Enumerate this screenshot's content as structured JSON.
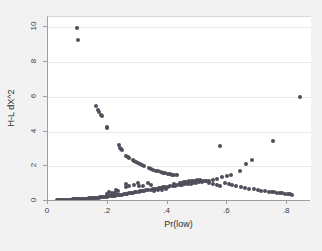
{
  "chart_data": {
    "type": "scatter",
    "title": "",
    "xlabel": "Pr(low)",
    "ylabel": "H-L dX^2",
    "xlim": [
      0,
      0.88
    ],
    "ylim": [
      0,
      10.6
    ],
    "xticks": [
      0,
      0.2,
      0.4,
      0.6,
      0.8
    ],
    "xticklabels": [
      "0",
      ".2",
      ".4",
      ".6",
      ".8"
    ],
    "yticks": [
      0,
      2,
      4,
      6,
      8,
      10
    ],
    "yticklabels": [
      "0",
      "2",
      "4",
      "6",
      "8",
      "10"
    ],
    "grid": "horizontal",
    "legend": "none",
    "marker_color": "#4f4f5a",
    "plot_bgcolor": "#ffffff",
    "figure_bgcolor": "#f2f2f2",
    "series": [
      {
        "name": "H-L dX^2 vs Pr(low)",
        "points": [
          [
            0.098,
            9.95
          ],
          [
            0.1,
            9.27
          ],
          [
            0.842,
            6.02
          ],
          [
            0.162,
            5.48
          ],
          [
            0.168,
            5.22
          ],
          [
            0.172,
            5.1
          ],
          [
            0.176,
            4.96
          ],
          [
            0.18,
            4.88
          ],
          [
            0.196,
            4.27
          ],
          [
            0.198,
            4.18
          ],
          [
            0.238,
            3.22
          ],
          [
            0.241,
            3.08
          ],
          [
            0.245,
            3.02
          ],
          [
            0.249,
            2.92
          ],
          [
            0.262,
            2.6
          ],
          [
            0.268,
            2.52
          ],
          [
            0.272,
            2.46
          ],
          [
            0.283,
            2.36
          ],
          [
            0.289,
            2.3
          ],
          [
            0.295,
            2.24
          ],
          [
            0.301,
            2.2
          ],
          [
            0.308,
            2.14
          ],
          [
            0.315,
            2.08
          ],
          [
            0.322,
            2.04
          ],
          [
            0.338,
            1.9
          ],
          [
            0.345,
            1.84
          ],
          [
            0.352,
            1.8
          ],
          [
            0.362,
            1.74
          ],
          [
            0.369,
            1.7
          ],
          [
            0.378,
            1.68
          ],
          [
            0.386,
            1.64
          ],
          [
            0.393,
            1.6
          ],
          [
            0.401,
            1.58
          ],
          [
            0.409,
            1.54
          ],
          [
            0.416,
            1.52
          ],
          [
            0.423,
            1.5
          ],
          [
            0.431,
            1.48
          ],
          [
            0.575,
            3.16
          ],
          [
            0.752,
            3.46
          ],
          [
            0.683,
            2.34
          ],
          [
            0.662,
            2.12
          ],
          [
            0.641,
            1.72
          ],
          [
            0.612,
            1.48
          ],
          [
            0.598,
            1.44
          ],
          [
            0.583,
            1.36
          ],
          [
            0.566,
            1.28
          ],
          [
            0.552,
            1.22
          ],
          [
            0.54,
            1.18
          ],
          [
            0.528,
            1.14
          ],
          [
            0.516,
            1.1
          ],
          [
            0.506,
            1.08
          ],
          [
            0.496,
            1.04
          ],
          [
            0.486,
            1.02
          ],
          [
            0.477,
            1.0
          ],
          [
            0.468,
            0.98
          ],
          [
            0.459,
            0.96
          ],
          [
            0.45,
            0.94
          ],
          [
            0.441,
            0.92
          ],
          [
            0.433,
            0.9
          ],
          [
            0.425,
            0.88
          ],
          [
            0.417,
            0.86
          ],
          [
            0.409,
            0.84
          ],
          [
            0.401,
            0.82
          ],
          [
            0.393,
            0.8
          ],
          [
            0.386,
            0.78
          ],
          [
            0.378,
            0.76
          ],
          [
            0.371,
            0.74
          ],
          [
            0.364,
            0.72
          ],
          [
            0.357,
            0.7
          ],
          [
            0.35,
            0.68
          ],
          [
            0.343,
            0.66
          ],
          [
            0.336,
            0.64
          ],
          [
            0.329,
            0.62
          ],
          [
            0.322,
            0.6
          ],
          [
            0.316,
            0.58
          ],
          [
            0.309,
            0.56
          ],
          [
            0.303,
            0.54
          ],
          [
            0.296,
            0.52
          ],
          [
            0.29,
            0.5
          ],
          [
            0.284,
            0.48
          ],
          [
            0.278,
            0.46
          ],
          [
            0.272,
            0.44
          ],
          [
            0.266,
            0.42
          ],
          [
            0.26,
            0.4
          ],
          [
            0.254,
            0.38
          ],
          [
            0.248,
            0.36
          ],
          [
            0.242,
            0.34
          ],
          [
            0.236,
            0.33
          ],
          [
            0.23,
            0.32
          ],
          [
            0.224,
            0.3
          ],
          [
            0.219,
            0.29
          ],
          [
            0.213,
            0.28
          ],
          [
            0.207,
            0.27
          ],
          [
            0.202,
            0.26
          ],
          [
            0.196,
            0.25
          ],
          [
            0.191,
            0.24
          ],
          [
            0.185,
            0.23
          ],
          [
            0.18,
            0.22
          ],
          [
            0.174,
            0.21
          ],
          [
            0.169,
            0.2
          ],
          [
            0.164,
            0.19
          ],
          [
            0.158,
            0.18
          ],
          [
            0.153,
            0.17
          ],
          [
            0.148,
            0.16
          ],
          [
            0.143,
            0.16
          ],
          [
            0.138,
            0.15
          ],
          [
            0.133,
            0.14
          ],
          [
            0.128,
            0.14
          ],
          [
            0.123,
            0.13
          ],
          [
            0.118,
            0.12
          ],
          [
            0.113,
            0.12
          ],
          [
            0.108,
            0.11
          ],
          [
            0.103,
            0.11
          ],
          [
            0.098,
            0.1
          ],
          [
            0.093,
            0.1
          ],
          [
            0.088,
            0.09
          ],
          [
            0.083,
            0.09
          ],
          [
            0.078,
            0.08
          ],
          [
            0.073,
            0.08
          ],
          [
            0.068,
            0.07
          ],
          [
            0.063,
            0.07
          ],
          [
            0.058,
            0.06
          ],
          [
            0.053,
            0.06
          ],
          [
            0.048,
            0.05
          ],
          [
            0.043,
            0.05
          ],
          [
            0.038,
            0.04
          ],
          [
            0.034,
            0.04
          ],
          [
            0.03,
            0.03
          ],
          [
            0.262,
            0.78
          ],
          [
            0.272,
            0.88
          ],
          [
            0.287,
            0.92
          ],
          [
            0.305,
            0.88
          ],
          [
            0.318,
            0.84
          ],
          [
            0.227,
            0.62
          ],
          [
            0.234,
            0.55
          ],
          [
            0.356,
            0.58
          ],
          [
            0.368,
            0.62
          ],
          [
            0.382,
            0.66
          ],
          [
            0.396,
            0.7
          ],
          [
            0.455,
            1.08
          ],
          [
            0.463,
            1.12
          ],
          [
            0.472,
            1.14
          ],
          [
            0.481,
            1.16
          ],
          [
            0.49,
            1.18
          ],
          [
            0.499,
            1.2
          ],
          [
            0.508,
            1.2
          ],
          [
            0.518,
            1.18
          ],
          [
            0.53,
            1.14
          ],
          [
            0.592,
            1.02
          ],
          [
            0.604,
            0.96
          ],
          [
            0.617,
            0.9
          ],
          [
            0.629,
            0.86
          ],
          [
            0.646,
            0.8
          ],
          [
            0.658,
            0.76
          ],
          [
            0.672,
            0.72
          ],
          [
            0.689,
            0.68
          ],
          [
            0.701,
            0.64
          ],
          [
            0.714,
            0.6
          ],
          [
            0.726,
            0.58
          ],
          [
            0.739,
            0.54
          ],
          [
            0.748,
            0.52
          ],
          [
            0.757,
            0.5
          ],
          [
            0.766,
            0.48
          ],
          [
            0.775,
            0.46
          ],
          [
            0.784,
            0.44
          ],
          [
            0.793,
            0.42
          ],
          [
            0.802,
            0.4
          ],
          [
            0.811,
            0.38
          ],
          [
            0.818,
            0.36
          ],
          [
            0.44,
            1.02
          ],
          [
            0.448,
            1.04
          ],
          [
            0.422,
            0.96
          ],
          [
            0.336,
            1.06
          ],
          [
            0.3,
            1.02
          ],
          [
            0.26,
            0.96
          ],
          [
            0.345,
            0.94
          ],
          [
            0.54,
            1.06
          ],
          [
            0.552,
            1.0
          ],
          [
            0.564,
            0.94
          ],
          [
            0.576,
            0.88
          ],
          [
            0.205,
            0.54
          ],
          [
            0.213,
            0.48
          ],
          [
            0.223,
            0.44
          ],
          [
            0.196,
            0.4
          ]
        ]
      }
    ]
  }
}
